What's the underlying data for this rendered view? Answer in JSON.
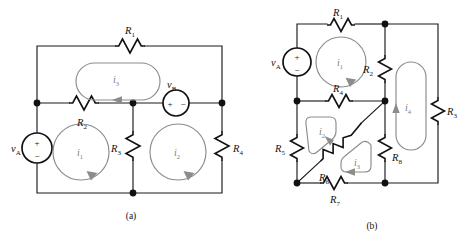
{
  "figure": {
    "background_color": "#ffffff",
    "wire_color": "#1a1a1a",
    "mesh_color": "#8c8c8c",
    "width": 470,
    "height": 246
  },
  "panels": [
    {
      "id": "panel-a",
      "caption": "(a)",
      "caption_x": 131,
      "caption_y": 218,
      "sources": [
        {
          "name": "source-va",
          "label": "v",
          "sub": "A",
          "label_x": 12,
          "label_y": 152,
          "cx": 37,
          "cy": 148,
          "r": 15,
          "orientation": "vertical",
          "plus": "+",
          "minus": "−",
          "plus_x": 37,
          "plus_y": 143,
          "minus_x": 37,
          "minus_y": 157
        },
        {
          "name": "source-vb",
          "label": "v",
          "sub": "B",
          "label_x": 168,
          "label_y": 88,
          "cx": 176,
          "cy": 103,
          "r": 13,
          "orientation": "horizontal",
          "plus": "+",
          "minus": "−",
          "plus_x": 170,
          "plus_y": 106,
          "minus_x": 183,
          "minus_y": 106
        }
      ],
      "resistors": [
        {
          "name": "resistor-r1",
          "label": "R",
          "sub": "1",
          "label_x": 125,
          "label_y": 34,
          "orientation": "horizontal",
          "x": 115,
          "y": 46,
          "len": 30
        },
        {
          "name": "resistor-r2",
          "label": "R",
          "sub": "2",
          "label_x": 78,
          "label_y": 126,
          "orientation": "horizontal",
          "x": 69,
          "y": 103,
          "len": 30
        },
        {
          "name": "resistor-r3",
          "label": "R",
          "sub": "3",
          "label_x": 112,
          "label_y": 152,
          "orientation": "vertical",
          "x": 133,
          "y": 131,
          "len": 30
        },
        {
          "name": "resistor-r4",
          "label": "R",
          "sub": "4",
          "label_x": 232,
          "label_y": 152,
          "orientation": "vertical",
          "x": 222,
          "y": 131,
          "len": 30
        }
      ],
      "meshes": [
        {
          "name": "mesh-i1",
          "label": "i",
          "sub": "1",
          "shape": "circle",
          "cx": 81,
          "cy": 152,
          "r": 28,
          "label_x": 77,
          "label_y": 156
        },
        {
          "name": "mesh-i2",
          "label": "i",
          "sub": "2",
          "shape": "circle",
          "cx": 178,
          "cy": 152,
          "r": 28,
          "label_x": 174,
          "label_y": 156
        },
        {
          "name": "mesh-i3",
          "label": "i",
          "sub": "3",
          "shape": "stadium",
          "x": 76,
          "y": 63,
          "w": 84,
          "h": 37,
          "label_x": 114,
          "label_y": 82
        }
      ],
      "nodes": [
        {
          "name": "node-left-mid",
          "x": 37,
          "y": 103
        },
        {
          "name": "node-center-mid",
          "x": 133,
          "y": 103
        },
        {
          "name": "node-right-mid",
          "x": 222,
          "y": 103
        },
        {
          "name": "node-bottom-center",
          "x": 133,
          "y": 193
        }
      ]
    },
    {
      "id": "panel-b",
      "caption": "(b)",
      "caption_x": 372,
      "caption_y": 228,
      "sources": [
        {
          "name": "source-va",
          "label": "v",
          "sub": "A",
          "label_x": 272,
          "label_y": 66,
          "cx": 297,
          "cy": 62,
          "r": 14,
          "orientation": "vertical",
          "plus": "+",
          "minus": "−",
          "plus_x": 297,
          "plus_y": 57,
          "minus_x": 297,
          "minus_y": 71
        }
      ],
      "resistors": [
        {
          "name": "resistor-r1",
          "label": "R",
          "sub": "1",
          "label_x": 334,
          "label_y": 15,
          "orientation": "horizontal",
          "x": 327,
          "y": 25,
          "len": 28
        },
        {
          "name": "resistor-r2",
          "label": "R",
          "sub": "2",
          "label_x": 364,
          "label_y": 73,
          "orientation": "vertical",
          "x": 385,
          "y": 55,
          "len": 28
        },
        {
          "name": "resistor-r3",
          "label": "R",
          "sub": "3",
          "label_x": 445,
          "label_y": 115,
          "orientation": "vertical",
          "x": 435,
          "y": 97,
          "len": 28
        },
        {
          "name": "resistor-r4",
          "label": "R",
          "sub": "4",
          "label_x": 334,
          "label_y": 91,
          "orientation": "horizontal",
          "x": 325,
          "y": 101,
          "len": 28
        },
        {
          "name": "resistor-r5",
          "label": "R",
          "sub": "5",
          "label_x": 276,
          "label_y": 153,
          "orientation": "vertical",
          "x": 297,
          "y": 134,
          "len": 28
        },
        {
          "name": "resistor-r6",
          "label": "R",
          "sub": "6",
          "label_x": 321,
          "label_y": 180,
          "orientation": "diagonal",
          "x1": 297,
          "y1": 183,
          "x2": 385,
          "y2": 101
        },
        {
          "name": "resistor-r7",
          "label": "R",
          "sub": "7",
          "label_x": 334,
          "label_y": 202,
          "orientation": "horizontal",
          "x": 320,
          "y": 183,
          "len": 28
        },
        {
          "name": "resistor-r8",
          "label": "R",
          "sub": "8",
          "label_x": 391,
          "label_y": 160,
          "orientation": "vertical",
          "x": 385,
          "y": 134,
          "len": 28
        }
      ],
      "meshes": [
        {
          "name": "mesh-i1",
          "label": "i",
          "sub": "1",
          "shape": "circle",
          "cx": 341,
          "cy": 62,
          "r": 25,
          "label_x": 337,
          "label_y": 66
        },
        {
          "name": "mesh-i2",
          "label": "i",
          "sub": "2",
          "shape": "poly",
          "label_x": 322,
          "label_y": 135
        },
        {
          "name": "mesh-i3",
          "label": "i",
          "sub": "3",
          "shape": "poly",
          "label_x": 357,
          "label_y": 165
        },
        {
          "name": "mesh-i4",
          "label": "i",
          "sub": "4",
          "shape": "stadium",
          "x": 396,
          "y": 62,
          "w": 30,
          "h": 88,
          "label_x": 407,
          "label_y": 110
        }
      ],
      "nodes": [
        {
          "name": "node-top-right",
          "x": 385,
          "y": 24
        },
        {
          "name": "node-left-mid",
          "x": 297,
          "y": 101
        },
        {
          "name": "node-center-mid",
          "x": 385,
          "y": 101
        },
        {
          "name": "node-bottom-left",
          "x": 297,
          "y": 183
        },
        {
          "name": "node-bottom-center",
          "x": 385,
          "y": 183
        }
      ]
    }
  ]
}
